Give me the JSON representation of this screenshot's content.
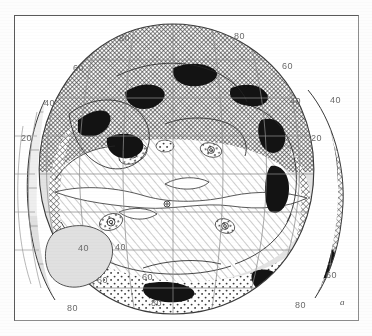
{
  "figure": {
    "panel_label": "a",
    "kind": "world-map-interrupted-globular-projection",
    "background_color": "#ffffff",
    "frame_color": "#5a5a5a",
    "graticule_color": "#8a8a8a",
    "coastline_color": "#2b2b2b"
  },
  "chart_data": {
    "type": "map",
    "title": "",
    "subtitle": "",
    "xlabel": "",
    "ylabel": "",
    "projection": "interrupted globular / oval (two lateral lobes)",
    "grid": true,
    "legend_position": "none",
    "graticule": {
      "latitude_interval_deg": 20,
      "longitude_interval_deg": 20,
      "labelled_latitudes": [
        20,
        40,
        60,
        80
      ]
    },
    "latitude_labels": [
      {
        "text": "80",
        "x": 118,
        "y": 33,
        "note": "north, left lobe crest"
      },
      {
        "text": "80",
        "x": 233,
        "y": 31,
        "note": "north, right lobe crest"
      },
      {
        "text": "60",
        "x": 72,
        "y": 63,
        "note": "north-west limb"
      },
      {
        "text": "60",
        "x": 281,
        "y": 61,
        "note": "north-east limb"
      },
      {
        "text": "40",
        "x": 43,
        "y": 98,
        "note": "north-west limb"
      },
      {
        "text": "40",
        "x": 289,
        "y": 96,
        "note": "north-east limb inner"
      },
      {
        "text": "40",
        "x": 329,
        "y": 95,
        "note": "north-east outer lobe"
      },
      {
        "text": "20",
        "x": 20,
        "y": 133,
        "note": "west limb"
      },
      {
        "text": "20",
        "x": 310,
        "y": 133,
        "note": "east outer lobe"
      },
      {
        "text": "40",
        "x": 77,
        "y": 243,
        "note": "south-west inner lobe"
      },
      {
        "text": "40",
        "x": 114,
        "y": 242,
        "note": "south-west limb"
      },
      {
        "text": "60",
        "x": 96,
        "y": 275,
        "note": "south-west limb"
      },
      {
        "text": "60",
        "x": 141,
        "y": 272,
        "note": "south inner"
      },
      {
        "text": "60",
        "x": 325,
        "y": 270,
        "note": "south-east limb"
      },
      {
        "text": "80",
        "x": 66,
        "y": 303,
        "note": "south-west lobe"
      },
      {
        "text": "80",
        "x": 150,
        "y": 298,
        "note": "south, left of centre"
      },
      {
        "text": "80",
        "x": 294,
        "y": 300,
        "note": "south-east lobe"
      }
    ],
    "fill_patterns": [
      {
        "name": "diagonal-hatch",
        "description": "fine diagonal line hatching (major interior province)"
      },
      {
        "name": "cross-hatch",
        "description": "crossed diagonal hatching (marginal / shelf province)"
      },
      {
        "name": "stipple",
        "description": "dotted stipple (southern ocean province)"
      },
      {
        "name": "solid-black",
        "description": "solid black belts along continental margins"
      },
      {
        "name": "light-grey",
        "description": "flat pale grey (outer lobes / land masses)"
      },
      {
        "name": "white",
        "description": "unfilled, blank areas"
      }
    ]
  }
}
